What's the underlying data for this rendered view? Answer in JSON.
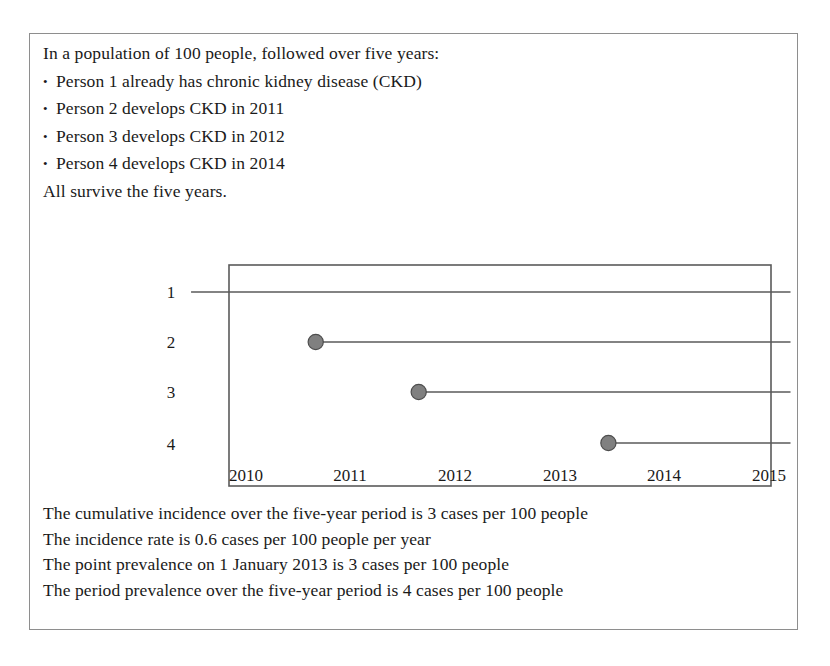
{
  "figure": {
    "premise": {
      "intro": "In a population of 100 people, followed over five years:",
      "bullet_glyph": "•",
      "bullets": [
        "Person 1 already has chronic kidney disease (CKD)",
        "Person 2 develops CKD in 2011",
        "Person 3 develops CKD in 2012",
        "Person 4 develops CKD in 2014"
      ],
      "closing": "All survive the five years."
    },
    "conclusions": [
      "The cumulative incidence over the five-year period is 3 cases per 100 people",
      "The incidence rate is 0.6 cases per 100 people per year",
      "The point prevalence on 1 January 2013 is 3 cases per 100 people",
      "The period prevalence over the five-year period is 4 cases per 100 people"
    ]
  },
  "chart_data": {
    "type": "line",
    "title": "",
    "xlabel": "",
    "ylabel": "",
    "x_tick_labels": [
      "2010",
      "2011",
      "2012",
      "2013",
      "2014",
      "2015"
    ],
    "x_tick_values": [
      2010,
      2011,
      2012,
      2013,
      2014,
      2015
    ],
    "y_tick_labels": [
      "1",
      "2",
      "3",
      "4"
    ],
    "y_tick_values": [
      1,
      2,
      3,
      4
    ],
    "xlim": [
      2010,
      2015
    ],
    "ylim": [
      0.5,
      4.5
    ],
    "grid": false,
    "legend": "none",
    "series": [
      {
        "name": "Person 1",
        "person": 1,
        "onset_year": null,
        "onset_marker": false,
        "line_start": 2009.65,
        "line_end": 2015.18,
        "note": "already has CKD before follow-up begins"
      },
      {
        "name": "Person 2",
        "person": 2,
        "onset_year": 2010.8,
        "onset_marker": true,
        "line_start": 2010.8,
        "line_end": 2015.18,
        "note": "develops CKD in 2011"
      },
      {
        "name": "Person 3",
        "person": 3,
        "onset_year": 2011.75,
        "onset_marker": true,
        "line_start": 2011.75,
        "line_end": 2015.18,
        "note": "develops CKD in 2012"
      },
      {
        "name": "Person 4",
        "person": 4,
        "onset_year": 2013.5,
        "onset_marker": true,
        "line_start": 2013.5,
        "line_end": 2015.18,
        "note": "develops CKD in 2014"
      }
    ],
    "colors": {
      "line": "#5a5a5a",
      "marker_fill": "#808080",
      "marker_stroke": "#4d4d4d",
      "plot_border": "#5a5a5a",
      "figure_border": "#8e8e8e",
      "text": "#1a1a1a"
    }
  }
}
